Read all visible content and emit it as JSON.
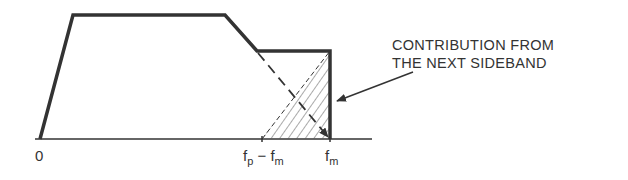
{
  "figure": {
    "colors": {
      "background": "#ffffff",
      "line": "#333333",
      "hatch": "#555555"
    },
    "axis": {
      "ticks": [
        {
          "name": "origin",
          "label": "0"
        },
        {
          "name": "fp-minus-fm",
          "label_main1": "f",
          "label_sub1": "p",
          "label_minus": " − ",
          "label_main2": "f",
          "label_sub2": "m"
        },
        {
          "name": "fm",
          "label_main": "f",
          "label_sub": "m"
        }
      ]
    },
    "annotation": {
      "line1": "CONTRIBUTION FROM",
      "line2": "THE NEXT SIDEBAND"
    }
  }
}
